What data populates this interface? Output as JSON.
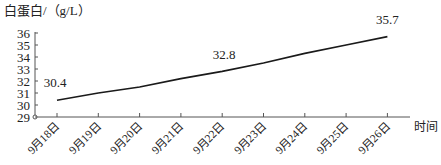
{
  "chart_data": {
    "type": "line",
    "title": "",
    "ylabel": "白蛋白/（g/L）",
    "xlabel": "时间",
    "ylim": [
      29,
      36
    ],
    "yticks": [
      29,
      30,
      31,
      32,
      33,
      34,
      35,
      36
    ],
    "categories": [
      "9月18日",
      "9月19日",
      "9月20日",
      "9月21日",
      "9月22日",
      "9月23日",
      "9月24日",
      "9月25日",
      "9月26日"
    ],
    "series": [
      {
        "name": "白蛋白",
        "values": [
          30.4,
          31.0,
          31.5,
          32.2,
          32.8,
          33.5,
          34.3,
          35.0,
          35.7
        ]
      }
    ],
    "annotations": [
      {
        "index": 0,
        "text": "30.4"
      },
      {
        "index": 4,
        "text": "32.8"
      },
      {
        "index": 8,
        "text": "35.7"
      }
    ],
    "grid": false,
    "legend": "none"
  }
}
